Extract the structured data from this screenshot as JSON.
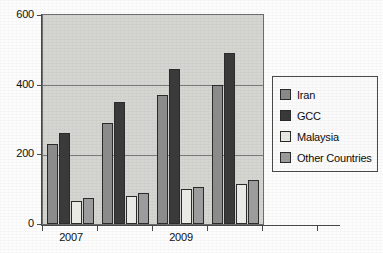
{
  "chart_data": {
    "type": "bar",
    "title": "",
    "xlabel": "",
    "ylabel": "",
    "categories": [
      "2007",
      "",
      "2009",
      ""
    ],
    "tick_labels_visible": [
      "2007",
      "2009"
    ],
    "ylim": [
      0,
      600
    ],
    "yticks": [
      0,
      200,
      400,
      600
    ],
    "ytick_labels": [
      "0",
      "200",
      "400",
      "600"
    ],
    "grid": true,
    "legend_position": "right",
    "series": [
      {
        "name": "Iran",
        "color": "#8b8b8b",
        "values": [
          230,
          290,
          370,
          400
        ]
      },
      {
        "name": "GCC",
        "color": "#3a3a3a",
        "values": [
          260,
          350,
          445,
          490
        ]
      },
      {
        "name": "Malaysia",
        "color": "#e9e9e6",
        "values": [
          65,
          80,
          100,
          115
        ]
      },
      {
        "name": "Other Countries",
        "color": "#9c9c9c",
        "values": [
          75,
          88,
          107,
          125
        ]
      }
    ]
  },
  "legend": {
    "items": [
      {
        "label": "Iran"
      },
      {
        "label": "GCC"
      },
      {
        "label": "Malaysia"
      },
      {
        "label": "Other Countries"
      }
    ]
  },
  "axes": {
    "y_labels": [
      "600",
      "400",
      "200",
      "0"
    ],
    "x_labels": [
      "2007",
      "2009"
    ]
  },
  "colors": {
    "plot_background": "#d5d5d1",
    "page_background": "#fdfdfd",
    "axis": "#4a4a4a",
    "gridline": "#7a7a7a",
    "bar_outline": "#2b2b2b"
  }
}
